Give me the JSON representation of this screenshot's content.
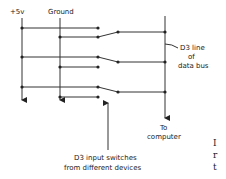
{
  "labels": {
    "supply": "+5v",
    "ground": "Ground",
    "bus_line_1": "D3 line",
    "bus_line_2": "of",
    "bus_line_3": "data bus",
    "to_1": "To",
    "to_2": "computer",
    "input_1": "D3 input switches",
    "input_2": "from different devices"
  },
  "switches": [
    {
      "name": "switch-1",
      "state": "ground"
    },
    {
      "name": "switch-2",
      "state": "supply"
    },
    {
      "name": "switch-3",
      "state": "supply"
    }
  ],
  "edge_text": {
    "line_1": "I",
    "line_2": "r",
    "line_3": "t"
  }
}
